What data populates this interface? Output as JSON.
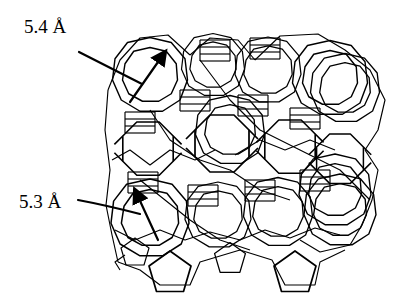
{
  "figure": {
    "type": "zeolite framework line drawing",
    "annotations": [
      {
        "id": "pore-top",
        "label": "5.4 Å",
        "value": 5.4,
        "unit": "Å"
      },
      {
        "id": "pore-bottom",
        "label": "5.3 Å",
        "value": 5.3,
        "unit": "Å"
      }
    ],
    "colors": {
      "line": "#000000",
      "background": "#ffffff"
    }
  }
}
